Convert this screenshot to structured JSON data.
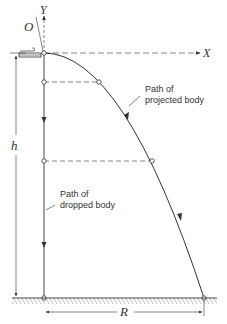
{
  "diagram": {
    "labels": {
      "origin": "O",
      "y_axis": "Y",
      "x_axis": "X",
      "height": "h",
      "range": "R",
      "projected_path": "Path of\nprojected body",
      "dropped_path": "Path of\ndropped body"
    },
    "colors": {
      "line": "#333333",
      "dashed": "#666666",
      "background": "#ffffff"
    }
  }
}
